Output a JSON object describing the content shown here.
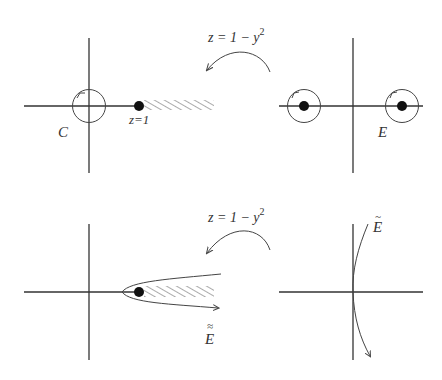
{
  "figure": {
    "panels": [
      {
        "id": "top-left",
        "label_contour": "C",
        "label_point": "z=1",
        "description": "z-plane with contour C around origin, branch point z=1 and hatched branch cut to the right"
      },
      {
        "id": "top-map",
        "map_label": "z = 1 − y",
        "map_exponent": "2"
      },
      {
        "id": "top-right",
        "label_contour": "E",
        "description": "y-plane with two small circles around the two preimage points"
      },
      {
        "id": "bottom-left",
        "label_contour": "E",
        "label_accent": "≈",
        "description": "z-plane with hairpin contour wrapping branch point and cut"
      },
      {
        "id": "bottom-map",
        "map_label": "z = 1 − y",
        "map_exponent": "2"
      },
      {
        "id": "bottom-right",
        "label_contour": "E",
        "label_accent": "~",
        "description": "y-plane with contour passing vertically near origin"
      }
    ],
    "colors": {
      "ink": "#333333",
      "background": "#ffffff"
    }
  }
}
